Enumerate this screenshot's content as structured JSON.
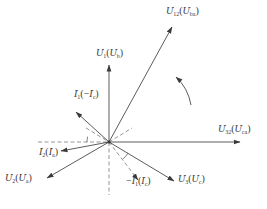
{
  "diagram": {
    "colors": {
      "line": "#4a4a4a",
      "dashed": "#8a8a8a",
      "text": "#3a3a3a"
    },
    "origin": [
      109,
      142
    ],
    "phasors": [
      {
        "id": "U12",
        "label": "U̇12(U̇ba)",
        "main": "U",
        "main_sub": "12",
        "alt": "U",
        "alt_sub": "ba",
        "alt_sign": "",
        "main_sign": "",
        "end": [
          172,
          27
        ],
        "style": "solid",
        "label_pos": [
          166,
          6
        ]
      },
      {
        "id": "U1",
        "label": "U̇1(U̇b)",
        "main": "U",
        "main_sub": "1",
        "alt": "U",
        "alt_sub": "b",
        "alt_sign": "",
        "main_sign": "",
        "end": [
          109,
          65
        ],
        "style": "solid",
        "label_pos": [
          96,
          48
        ]
      },
      {
        "id": "I1",
        "label": "İ1(−İc)",
        "main": "I",
        "main_sub": "1",
        "alt": "I",
        "alt_sub": "c",
        "alt_sign": "−",
        "main_sign": "",
        "end": [
          76,
          112
        ],
        "style": "solid",
        "label_pos": [
          74,
          89
        ]
      },
      {
        "id": "U32",
        "label": "U̇32(U̇ca)",
        "main": "U",
        "main_sub": "32",
        "alt": "U",
        "alt_sub": "ca",
        "alt_sign": "",
        "main_sign": "",
        "end": [
          240,
          142
        ],
        "style": "solid",
        "label_pos": [
          218,
          124
        ]
      },
      {
        "id": "I2",
        "label": "İ2(İa)",
        "main": "I",
        "main_sub": "2",
        "alt": "I",
        "alt_sub": "a",
        "alt_sign": "",
        "main_sign": "",
        "end": [
          61,
          151
        ],
        "style": "solid",
        "label_pos": [
          39,
          147
        ]
      },
      {
        "id": "U2",
        "label": "U̇2(U̇a)",
        "main": "U",
        "main_sub": "2",
        "alt": "U",
        "alt_sub": "a",
        "alt_sign": "",
        "main_sign": "",
        "end": [
          47,
          178
        ],
        "style": "solid",
        "label_pos": [
          5,
          173
        ]
      },
      {
        "id": "mI1",
        "label": "−İ1(İc)",
        "main": "I",
        "main_sub": "1",
        "alt": "I",
        "alt_sub": "c",
        "alt_sign": "",
        "main_sign": "−",
        "end": [
          138,
          180
        ],
        "style": "dashed",
        "label_pos": [
          126,
          176
        ]
      },
      {
        "id": "U3",
        "label": "U̇3(U̇c)",
        "main": "U",
        "main_sub": "3",
        "alt": "U",
        "alt_sub": "c",
        "alt_sign": "",
        "main_sign": "",
        "end": [
          174,
          181
        ],
        "style": "solid",
        "label_pos": [
          178,
          174
        ]
      }
    ],
    "reference_lines": [
      {
        "from": [
          38,
          142
        ],
        "to": [
          109,
          142
        ]
      },
      {
        "from": [
          109,
          142
        ],
        "to": [
          109,
          195
        ]
      },
      {
        "from": [
          86,
          128
        ],
        "to": [
          109,
          142
        ]
      },
      {
        "from": [
          109,
          142
        ],
        "to": [
          132,
          128
        ]
      }
    ],
    "angle_marks": [
      {
        "cx": 109,
        "cy": 142,
        "r": 22,
        "from_deg": 180,
        "to_deg": 194
      },
      {
        "cx": 109,
        "cy": 142,
        "r": 22,
        "from_deg": 30,
        "to_deg": 52
      }
    ],
    "rotation_arrow": {
      "path": "M 191 105 Q 188 88 176 77",
      "direction": "counterclockwise"
    }
  }
}
